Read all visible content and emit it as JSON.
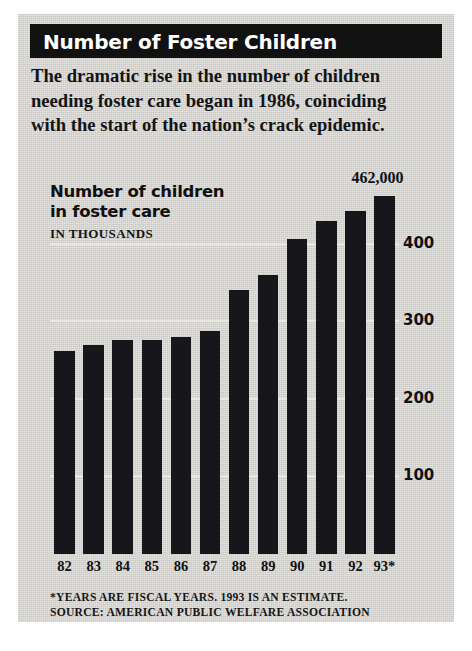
{
  "header": {
    "title": "Number of Foster Children"
  },
  "deck": {
    "line1": "The dramatic rise in the number of children",
    "line2": "needing foster care began in 1986, coinciding",
    "line3": "with the start of the nation’s crack epidemic."
  },
  "chart_label": {
    "line1": "Number of children",
    "line2": "in foster care",
    "units": "IN THOUSANDS"
  },
  "footnotes": {
    "line1": "*YEARS ARE FISCAL YEARS. 1993 IS AN ESTIMATE.",
    "line2": "SOURCE: AMERICAN PUBLIC WELFARE ASSOCIATION"
  },
  "colors": {
    "panel_background": "#d4d3cf",
    "title_bar": "#111111",
    "title_text": "#ffffff",
    "bar": "#17161a",
    "gridline": "#e8e7e3",
    "text": "#111111"
  },
  "chart_data": {
    "type": "bar",
    "title": "Number of children in foster care",
    "subtitle": "IN THOUSANDS",
    "xlabel": "",
    "ylabel": "IN THOUSANDS",
    "categories": [
      "82",
      "83",
      "84",
      "85",
      "86",
      "87",
      "88",
      "89",
      "90",
      "91",
      "92",
      "93*"
    ],
    "values": [
      262,
      269,
      276,
      276,
      280,
      288,
      340,
      360,
      406,
      429,
      442,
      462
    ],
    "annotations": [
      {
        "category": "93*",
        "text": "462,000",
        "value": 462
      }
    ],
    "yticks": [
      100,
      200,
      300,
      400
    ],
    "ytick_labels": [
      "100",
      "200",
      "300",
      "400"
    ],
    "ylim": [
      0,
      500
    ],
    "grid": true,
    "legend": false
  }
}
